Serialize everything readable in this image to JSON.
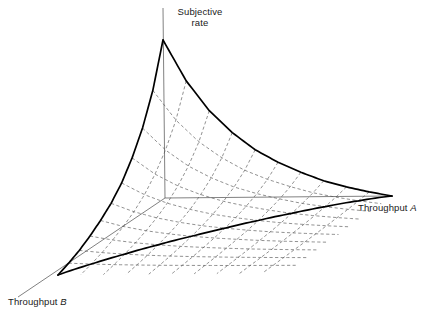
{
  "figure": {
    "type": "3d-surface-wireframe",
    "background_color": "#ffffff",
    "boundary_color": "#000000",
    "grid_color": "#555555",
    "axis_color": "#444444",
    "text_color": "#1a1a1a"
  },
  "labels": {
    "vertical_axis_line1": "Subjective",
    "vertical_axis_line2": "rate",
    "right_axis_prefix": "Throughput",
    "right_axis_variable": "A",
    "left_axis_prefix": "Throughput",
    "left_axis_variable": "B"
  },
  "chart_data": {
    "type": "line",
    "title": "",
    "subtitle": "",
    "xlabel": "Throughput A",
    "ylabel": "Throughput B",
    "zlabel": "Subjective rate",
    "grid": true,
    "legend": "none",
    "projection": {
      "origin": [
        165,
        198
      ],
      "apex": [
        163,
        40
      ],
      "vertex_a": [
        392,
        196
      ],
      "vertex_b": [
        58,
        275
      ],
      "axis_tip_vertical": [
        163,
        8
      ],
      "axis_tip_b": [
        18,
        297
      ]
    },
    "grid_divisions_a": 10,
    "grid_divisions_b": 10,
    "surface_curvature": "concave",
    "axes": {
      "x": {
        "label": "Throughput A",
        "range": [
          0,
          1
        ],
        "ticks": []
      },
      "y": {
        "label": "Throughput B",
        "range": [
          0,
          1
        ],
        "ticks": []
      },
      "z": {
        "label": "Subjective rate",
        "range": [
          0,
          1
        ],
        "ticks": []
      }
    },
    "series": [
      {
        "name": "Subjective rate surface",
        "edge_a": {
          "comment": "boundary from apex to Throughput A vertex (z vs a at b=0)",
          "a": [
            0.0,
            0.1,
            0.2,
            0.3,
            0.4,
            0.5,
            0.6,
            0.7,
            0.8,
            0.9,
            1.0
          ],
          "z": [
            1.0,
            0.74,
            0.55,
            0.41,
            0.3,
            0.22,
            0.155,
            0.1,
            0.06,
            0.027,
            0.0
          ]
        },
        "edge_b": {
          "comment": "boundary from apex to Throughput B vertex (z vs b at a=0)",
          "b": [
            0.0,
            0.1,
            0.2,
            0.3,
            0.4,
            0.5,
            0.6,
            0.7,
            0.8,
            0.9,
            1.0
          ],
          "z": [
            1.0,
            0.73,
            0.54,
            0.4,
            0.29,
            0.21,
            0.15,
            0.1,
            0.058,
            0.026,
            0.0
          ]
        },
        "edge_base": {
          "comment": "far boundary from Throughput B vertex to Throughput A vertex (z = 0)",
          "a": [
            0.0,
            0.25,
            0.5,
            0.75,
            1.0
          ],
          "b": [
            1.0,
            0.75,
            0.5,
            0.25,
            0.0
          ],
          "z": [
            0.0,
            0.0,
            0.0,
            0.0,
            0.0
          ]
        }
      }
    ]
  }
}
